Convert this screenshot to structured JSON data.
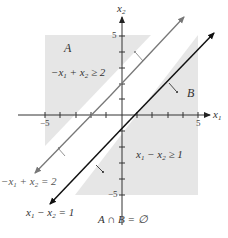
{
  "diagram": {
    "axes": {
      "x_label": "x",
      "x_label_sub": "1",
      "y_label": "x",
      "y_label_sub": "2",
      "x_ticks": {
        "neg": "−5",
        "pos": "5"
      },
      "y_ticks": {
        "pos": "5",
        "neg": "−5"
      }
    },
    "regions": {
      "A": {
        "name": "A",
        "inequality_pre": "−x",
        "inequality_sub1": "1",
        "inequality_mid": " + x",
        "inequality_sub2": "2",
        "inequality_post": " ≥ 2"
      },
      "B": {
        "name": "B",
        "inequality_pre": "x",
        "inequality_sub1": "1",
        "inequality_mid": " − x",
        "inequality_sub2": "2",
        "inequality_post": " ≥ 1"
      }
    },
    "lines": {
      "line_A": {
        "pre": "−x",
        "sub1": "1",
        "mid": " + x",
        "sub2": "2",
        "post": " = 2",
        "color": "#777777"
      },
      "line_B": {
        "pre": "x",
        "sub1": "1",
        "mid": " − x",
        "sub2": "2",
        "post": " = 1",
        "color": "#111111"
      }
    },
    "caption": "A ∩ B = ∅",
    "colors": {
      "shade": "#e6e6e6",
      "axis": "#333333"
    }
  }
}
